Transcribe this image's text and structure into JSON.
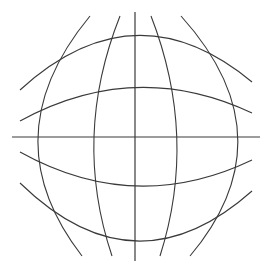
{
  "diagram": {
    "background": "#ffffff",
    "stroke_color": "#3a3a3a",
    "center": [
      135,
      137
    ],
    "horizontal_axis": {
      "x1": 12,
      "y1": 137,
      "x2": 260,
      "y2": 137
    },
    "vertical_axis": {
      "x1": 135,
      "y1": 12,
      "x2": 135,
      "y2": 261
    },
    "horizontal_curves": [
      {
        "name": "top-outer",
        "d": "M 20 90 Q 135 -15 252 82"
      },
      {
        "name": "top-inner",
        "d": "M 20 121 Q 135 58 252 113"
      },
      {
        "name": "bottom-inner",
        "d": "M 20 152 Q 135 216 252 160"
      },
      {
        "name": "bottom-outer",
        "d": "M 20 183 Q 135 295 252 191"
      }
    ],
    "vertical_curves": [
      {
        "name": "left-outer",
        "d": "M 90 16 Q -10 137 82 256"
      },
      {
        "name": "left-inner",
        "d": "M 120 16 Q 72 137 112 256"
      },
      {
        "name": "right-inner",
        "d": "M 151 16 Q 198 137 160 256"
      },
      {
        "name": "right-outer",
        "d": "M 181 16 Q 290 137 190 256"
      }
    ]
  }
}
